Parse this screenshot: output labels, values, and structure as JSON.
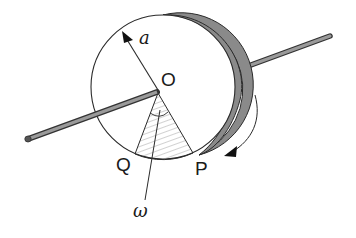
{
  "diagram": {
    "type": "rotating-disk-on-axle",
    "labels": {
      "radius": "a",
      "center": "O",
      "point_q": "Q",
      "point_p": "P",
      "angular_velocity": "ω"
    },
    "elements": [
      "disk-front-face",
      "disk-rim-thickness",
      "axle-rod",
      "radius-arrow",
      "shaded-sector-OQP",
      "angle-arc",
      "rotation-direction-arrow",
      "omega-pointer-line"
    ],
    "colors": {
      "line": "#2a2a2a",
      "rim_fill": "#8a8a8a",
      "rod_fill": "#8c8c8c",
      "hatch": "#9a9a9a",
      "background": "#ffffff"
    }
  }
}
